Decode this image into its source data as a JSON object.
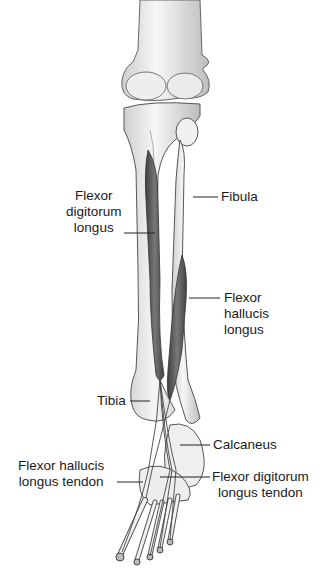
{
  "figure": {
    "labels": {
      "flexor_digitorum_longus": [
        "Flexor",
        "digitorum",
        "longus"
      ],
      "fibula": "Fibula",
      "flexor_hallucis_longus": [
        "Flexor",
        "hallucis",
        "longus"
      ],
      "tibia": "Tibia",
      "calcaneus": "Calcaneus",
      "flexor_hallucis_longus_tendon": [
        "Flexor hallucis",
        "longus tendon"
      ],
      "flexor_digitorum_longus_tendon": [
        "Flexor digitorum",
        "longus tendon"
      ]
    },
    "colors": {
      "bone_fill": "#f2f2f2",
      "bone_stroke": "#555555",
      "muscle_fill": "#6e6e6e",
      "muscle_dark": "#4a4a4a",
      "leader_line": "#222222",
      "text": "#1a1a1a"
    }
  }
}
